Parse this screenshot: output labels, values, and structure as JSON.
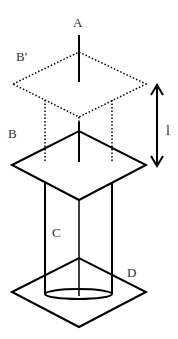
{
  "diagram": {
    "stroke_color": "#000000",
    "label_color": "#333333",
    "background": "#ffffff",
    "labels": {
      "A": "A",
      "B_prime": "B'",
      "B": "B",
      "C": "C",
      "D": "D",
      "l": "l"
    },
    "elements": [
      {
        "id": "rod-A",
        "type": "line",
        "description": "vertical rod labeled A"
      },
      {
        "id": "plate-B-prime",
        "type": "dotted-diamond",
        "description": "displaced plate position B'"
      },
      {
        "id": "plate-B",
        "type": "solid-diamond",
        "description": "plate B"
      },
      {
        "id": "cylinder-C",
        "type": "cylinder",
        "description": "cylinder C"
      },
      {
        "id": "base-D",
        "type": "solid-diamond",
        "description": "base plate D"
      },
      {
        "id": "distance-l",
        "type": "double-arrow",
        "description": "displacement distance l between B and B'"
      }
    ]
  }
}
